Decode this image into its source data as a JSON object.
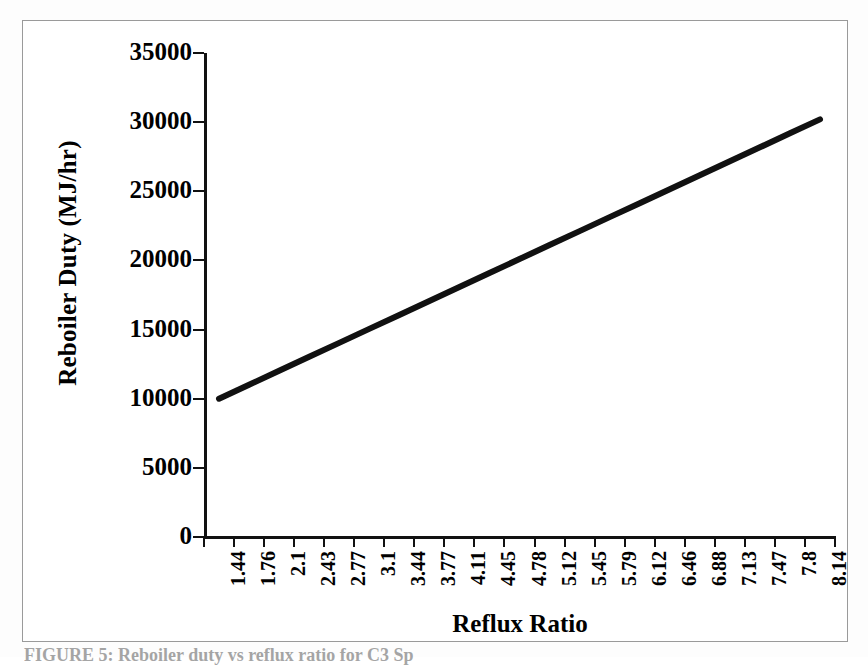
{
  "figure": {
    "caption": "FIGURE 5: Reboiler duty vs reflux ratio for C3 Sp"
  },
  "chart_data": {
    "type": "line",
    "title": "",
    "xlabel": "Reflux Ratio",
    "ylabel": "Reboiler Duty (MJ/hr)",
    "categories": [
      "1.44",
      "1.76",
      "2.1",
      "2.43",
      "2.77",
      "3.1",
      "3.44",
      "3.77",
      "4.11",
      "4.45",
      "4.78",
      "5.12",
      "5.45",
      "5.79",
      "6.12",
      "6.46",
      "6.88",
      "7.13",
      "7.47",
      "7.8",
      "8.14"
    ],
    "values": [
      10000,
      11010,
      12020,
      13030,
      14040,
      15050,
      16060,
      17070,
      18080,
      19090,
      20100,
      21110,
      22120,
      23130,
      24140,
      25150,
      26160,
      27170,
      28180,
      29190,
      30200
    ],
    "ylim": [
      0,
      35000
    ],
    "yticks": [
      0,
      5000,
      10000,
      15000,
      20000,
      25000,
      30000,
      35000
    ],
    "ytick_labels": [
      "0",
      "5000",
      "10000",
      "15000",
      "20000",
      "25000",
      "30000",
      "35000"
    ],
    "grid": false,
    "legend": "none",
    "series_color": "#111111",
    "series_width": 6
  }
}
